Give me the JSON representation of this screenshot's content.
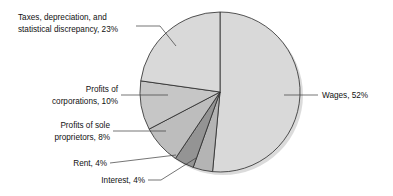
{
  "chart_data": {
    "type": "pie",
    "title": "",
    "subtitle": "",
    "xlabel": "",
    "ylabel": "",
    "legend_position": "none",
    "grid": false,
    "start_angle_deg": 0,
    "direction": "clockwise",
    "categories": [
      "Wages",
      "Interest",
      "Rent",
      "Profits of sole proprietors",
      "Profits of corporations",
      "Taxes, depreciation, and statistical discrepancy"
    ],
    "values": [
      52,
      4,
      4,
      8,
      10,
      23
    ],
    "units": "percent",
    "total": 101,
    "slices": [
      {
        "name": "Wages",
        "value": 52,
        "value_text": "52%",
        "label": "Wages, 52%",
        "color": "#d9d9d9",
        "start_deg": 0,
        "end_deg": 187.2
      },
      {
        "name": "Interest",
        "value": 4,
        "value_text": "4%",
        "label": "Interest, 4%",
        "color": "#b4b4b4",
        "start_deg": 187.2,
        "end_deg": 201.6
      },
      {
        "name": "Rent",
        "value": 4,
        "value_text": "4%",
        "label": "Rent, 4%",
        "color": "#949494",
        "start_deg": 201.6,
        "end_deg": 216.0
      },
      {
        "name": "Profits of sole proprietors",
        "value": 8,
        "value_text": "8%",
        "label": "Profits of sole proprietors, 8%",
        "color": "#bdbdbd",
        "start_deg": 216.0,
        "end_deg": 244.8
      },
      {
        "name": "Profits of corporations",
        "value": 10,
        "value_text": "10%",
        "label": "Profits of corporations, 10%",
        "color": "#c6c6c6",
        "start_deg": 244.8,
        "end_deg": 280.8
      },
      {
        "name": "Taxes, depreciation, and statistical discrepancy",
        "value": 23,
        "value_text": "23%",
        "label": "Taxes, depreciation, and statistical discrepancy, 23%",
        "color": "#d9d9d9",
        "start_deg": 280.8,
        "end_deg": 360.0
      }
    ]
  },
  "labels": {
    "taxes_line1": "Taxes, depreciation, and",
    "taxes_line2": "statistical discrepancy, 23%",
    "corporations_line1": "Profits of",
    "corporations_line2": "corporations, 10%",
    "sole_prop_line1": "Profits of sole",
    "sole_prop_line2": "proprietors, 8%",
    "rent": "Rent, 4%",
    "interest": "Interest, 4%",
    "wages": "Wages, 52%"
  },
  "colors": {
    "background": "#ffffff",
    "outline": "#2a2a2a",
    "text": "#111111",
    "leader": "#3a3a3a",
    "shadow": "#b9b9b9"
  }
}
